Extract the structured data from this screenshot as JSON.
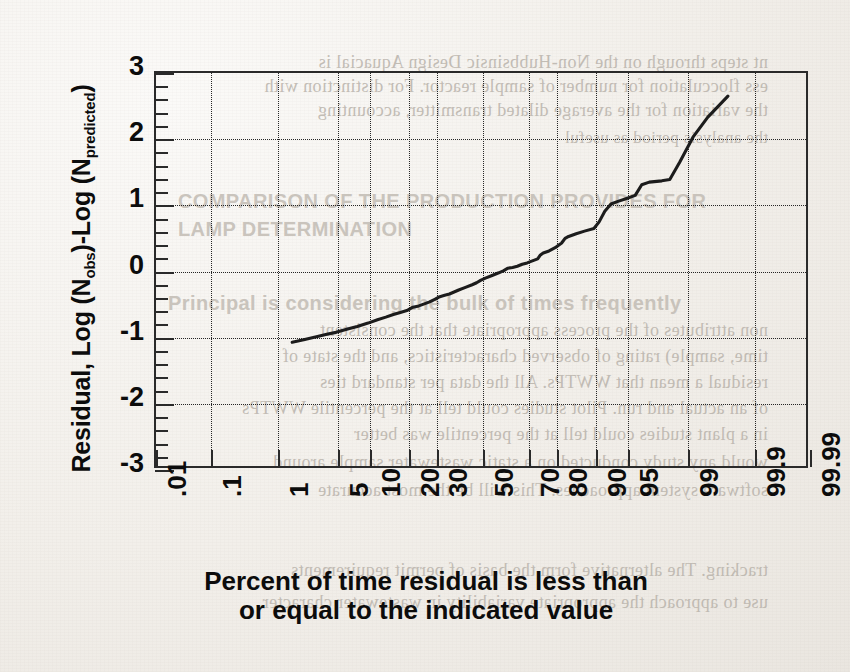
{
  "document": {
    "kind": "scanned-journal-page-figure",
    "bleed_through_text": [
      "nt steps through on the Non-Hubbsinsic Design Aquacial is",
      "ess flocculation for number of sample reactor. For distinction with",
      "the variation for the average dilated transmitter, accounting",
      "the analysis period as useful",
      "COMPARISON OF THE PRODUCTION PROVIDES FOR",
      "LAMP DETERMINATION",
      "Principal is considering the bulk of times frequently",
      "non attributes of the process appropriate that the consistent",
      "time, sample) rating of observed characteristics, and the state of",
      "residual a mean that WWTPs. All the data per standard ties",
      "of an actual and run. Pilot studies could tell at the percentile WWTPs",
      "in a plant studies could tell at the percentile was better",
      "would any study conducted on a static wastewater sample around",
      "software system approaches. This will be the most accurate",
      "tracking. The alternative form the basis of permit requirements",
      "use to approach the appropriate variability in wastewater character"
    ]
  },
  "chart_data": {
    "type": "line",
    "title": "",
    "xlabel": "Percent of time residual is less than or equal to the indicated value",
    "ylabel": "Residual, Log (Nobs)-Log (Npredicted)",
    "ylabel_parts": {
      "prefix": "Residual, Log (N",
      "sub1": "obs",
      "middle": ")-Log (N",
      "sub2": "predicted",
      "suffix": ")"
    },
    "x_scale": "probability (probit)",
    "x_tick_labels": [
      ".01",
      ".1",
      "1",
      "5",
      "10",
      "20",
      "30",
      "50",
      "70",
      "80",
      "90",
      "95",
      "99",
      "99.9",
      "99.99"
    ],
    "x_tick_values": [
      0.01,
      0.1,
      1,
      5,
      10,
      20,
      30,
      50,
      70,
      80,
      90,
      95,
      99,
      99.9,
      99.99
    ],
    "xlim": [
      0.01,
      99.99
    ],
    "y_tick_labels": [
      "3",
      "2",
      "1",
      "0",
      "-1",
      "-2",
      "-3"
    ],
    "y_tick_values": [
      3,
      2,
      1,
      0,
      -1,
      -2,
      -3
    ],
    "ylim": [
      -3,
      3
    ],
    "y_minor_ticks_per_major": 4,
    "grid": "dotted on both axes at major ticks",
    "legend": null,
    "series": [
      {
        "name": "Residual percentile curve",
        "color": "#1c1c1c",
        "points": [
          {
            "percent": 1.6,
            "residual": -1.1
          },
          {
            "percent": 2.2,
            "residual": -1.06
          },
          {
            "percent": 3.0,
            "residual": -1.02
          },
          {
            "percent": 4.0,
            "residual": -0.98
          },
          {
            "percent": 5.0,
            "residual": -0.95
          },
          {
            "percent": 6.5,
            "residual": -0.9
          },
          {
            "percent": 8.0,
            "residual": -0.86
          },
          {
            "percent": 10.0,
            "residual": -0.81
          },
          {
            "percent": 12.0,
            "residual": -0.76
          },
          {
            "percent": 14.0,
            "residual": -0.72
          },
          {
            "percent": 16.0,
            "residual": -0.68
          },
          {
            "percent": 18.0,
            "residual": -0.65
          },
          {
            "percent": 20.0,
            "residual": -0.62
          },
          {
            "percent": 22.0,
            "residual": -0.57
          },
          {
            "percent": 24.0,
            "residual": -0.55
          },
          {
            "percent": 26.0,
            "residual": -0.52
          },
          {
            "percent": 28.0,
            "residual": -0.49
          },
          {
            "percent": 30.0,
            "residual": -0.45
          },
          {
            "percent": 32.0,
            "residual": -0.41
          },
          {
            "percent": 34.0,
            "residual": -0.39
          },
          {
            "percent": 36.0,
            "residual": -0.37
          },
          {
            "percent": 38.0,
            "residual": -0.34
          },
          {
            "percent": 40.0,
            "residual": -0.31
          },
          {
            "percent": 43.0,
            "residual": -0.27
          },
          {
            "percent": 46.0,
            "residual": -0.23
          },
          {
            "percent": 48.0,
            "residual": -0.2
          },
          {
            "percent": 50.0,
            "residual": -0.16
          },
          {
            "percent": 52.0,
            "residual": -0.13
          },
          {
            "percent": 55.0,
            "residual": -0.09
          },
          {
            "percent": 58.0,
            "residual": -0.05
          },
          {
            "percent": 60.0,
            "residual": -0.02
          },
          {
            "percent": 62.0,
            "residual": 0.02
          },
          {
            "percent": 64.0,
            "residual": 0.03
          },
          {
            "percent": 66.0,
            "residual": 0.05
          },
          {
            "percent": 68.0,
            "residual": 0.08
          },
          {
            "percent": 70.0,
            "residual": 0.1
          },
          {
            "percent": 72.0,
            "residual": 0.13
          },
          {
            "percent": 74.0,
            "residual": 0.16
          },
          {
            "percent": 75.0,
            "residual": 0.22
          },
          {
            "percent": 76.0,
            "residual": 0.25
          },
          {
            "percent": 78.0,
            "residual": 0.28
          },
          {
            "percent": 80.0,
            "residual": 0.33
          },
          {
            "percent": 82.0,
            "residual": 0.4
          },
          {
            "percent": 83.0,
            "residual": 0.47
          },
          {
            "percent": 84.0,
            "residual": 0.5
          },
          {
            "percent": 86.0,
            "residual": 0.54
          },
          {
            "percent": 88.0,
            "residual": 0.58
          },
          {
            "percent": 90.0,
            "residual": 0.62
          },
          {
            "percent": 91.0,
            "residual": 0.72
          },
          {
            "percent": 92.0,
            "residual": 0.88
          },
          {
            "percent": 93.0,
            "residual": 0.99
          },
          {
            "percent": 94.0,
            "residual": 1.03
          },
          {
            "percent": 95.0,
            "residual": 1.07
          },
          {
            "percent": 96.0,
            "residual": 1.12
          },
          {
            "percent": 96.6,
            "residual": 1.28
          },
          {
            "percent": 97.2,
            "residual": 1.32
          },
          {
            "percent": 98.0,
            "residual": 1.34
          },
          {
            "percent": 98.4,
            "residual": 1.36
          },
          {
            "percent": 98.8,
            "residual": 1.62
          },
          {
            "percent": 99.2,
            "residual": 2.0
          },
          {
            "percent": 99.5,
            "residual": 2.3
          },
          {
            "percent": 99.75,
            "residual": 2.62
          }
        ]
      }
    ]
  }
}
